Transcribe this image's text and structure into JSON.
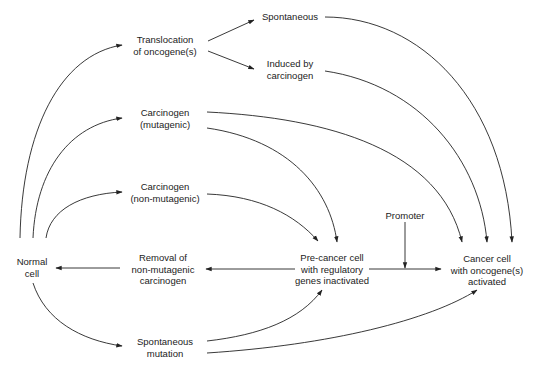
{
  "diagram": {
    "nodes": {
      "normal_cell": {
        "line1": "Normal",
        "line2": "cell"
      },
      "translocation": {
        "line1": "Translocation",
        "line2": "of oncogene(s)"
      },
      "spontaneous": {
        "line1": "Spontaneous"
      },
      "induced": {
        "line1": "Induced by",
        "line2": "carcinogen"
      },
      "carc_mut": {
        "line1": "Carcinogen",
        "line2": "(mutagenic)"
      },
      "carc_nonmut": {
        "line1": "Carcinogen",
        "line2": "(non-mutagenic)"
      },
      "removal": {
        "line1": "Removal of",
        "line2": "non-mutagenic",
        "line3": "carcinogen"
      },
      "precancer": {
        "line1": "Pre-cancer cell",
        "line2": "with regulatory",
        "line3": "genes inactivated"
      },
      "promoter": {
        "line1": "Promoter"
      },
      "cancer": {
        "line1": "Cancer cell",
        "line2": "with oncogene(s)",
        "line3": "activated"
      },
      "spont_mut": {
        "line1": "Spontaneous",
        "line2": "mutation"
      }
    },
    "edges": [
      {
        "from": "Normal cell",
        "to": "Translocation of oncogene(s)"
      },
      {
        "from": "Normal cell",
        "to": "Carcinogen (mutagenic)"
      },
      {
        "from": "Normal cell",
        "to": "Carcinogen (non-mutagenic)"
      },
      {
        "from": "Normal cell",
        "to": "Spontaneous mutation"
      },
      {
        "from": "Translocation of oncogene(s)",
        "to": "Spontaneous"
      },
      {
        "from": "Translocation of oncogene(s)",
        "to": "Induced by carcinogen"
      },
      {
        "from": "Spontaneous",
        "to": "Cancer cell with oncogene(s) activated"
      },
      {
        "from": "Induced by carcinogen",
        "to": "Cancer cell with oncogene(s) activated"
      },
      {
        "from": "Carcinogen (mutagenic)",
        "to": "Cancer cell with oncogene(s) activated"
      },
      {
        "from": "Carcinogen (mutagenic)",
        "to": "Pre-cancer cell with regulatory genes inactivated"
      },
      {
        "from": "Carcinogen (non-mutagenic)",
        "to": "Pre-cancer cell with regulatory genes inactivated"
      },
      {
        "from": "Pre-cancer cell with regulatory genes inactivated",
        "to": "Removal of non-mutagenic carcinogen"
      },
      {
        "from": "Removal of non-mutagenic carcinogen",
        "to": "Normal cell"
      },
      {
        "from": "Pre-cancer cell with regulatory genes inactivated",
        "to": "Cancer cell with oncogene(s) activated"
      },
      {
        "from": "Promoter",
        "to": "Pre-cancer → Cancer edge"
      },
      {
        "from": "Spontaneous mutation",
        "to": "Pre-cancer cell with regulatory genes inactivated"
      },
      {
        "from": "Spontaneous mutation",
        "to": "Cancer cell with oncogene(s) activated"
      }
    ]
  }
}
